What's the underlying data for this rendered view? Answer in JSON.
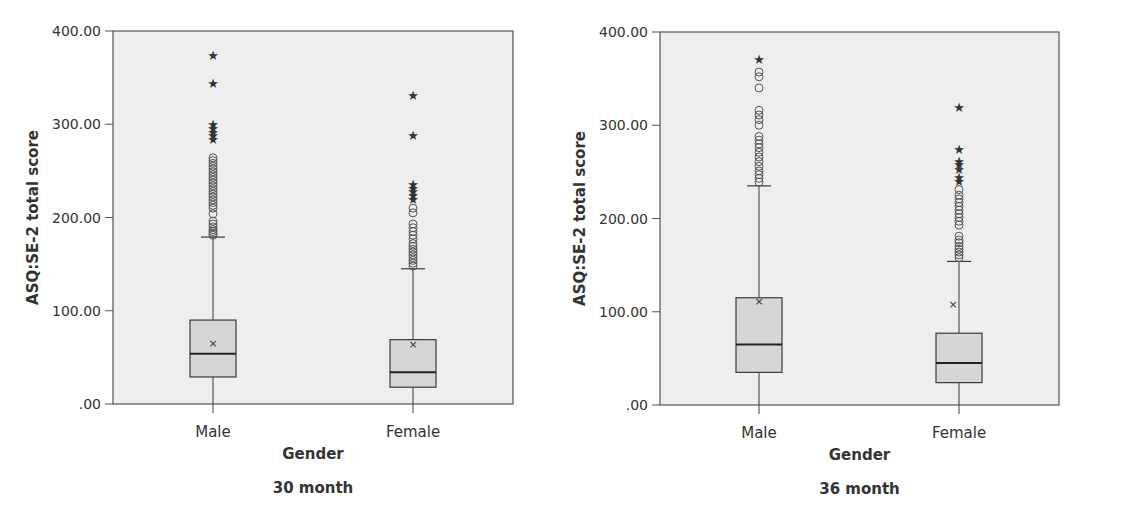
{
  "colors": {
    "plot_bg": "#eeeeee",
    "box_fill": "#d6d6d6",
    "line": "#3a3a3a",
    "text": "#333333"
  },
  "chart_data": [
    {
      "type": "box",
      "title": "30 month",
      "xlabel": "Gender",
      "ylabel": "ASQ:SE-2 total score",
      "ylim": [
        0,
        400
      ],
      "yticks": [
        ".00",
        "100.00",
        "200.00",
        "300.00",
        "400.00"
      ],
      "ytick_values": [
        0,
        100,
        200,
        300,
        400
      ],
      "grid": false,
      "categories": [
        "Male",
        "Female"
      ],
      "series": [
        {
          "name": "Male",
          "whisker_low": 0,
          "q1": 29,
          "median": 54,
          "q3": 90,
          "whisker_high": 179,
          "mean": 65,
          "outliers_circle": [
            181,
            183,
            185,
            187,
            190,
            193,
            196,
            204,
            210,
            213,
            216,
            219,
            222,
            225,
            228,
            231,
            234,
            237,
            240,
            243,
            246,
            249,
            252,
            255,
            258,
            261,
            264
          ],
          "outliers_extreme": [
            284,
            288,
            292,
            296,
            300,
            344,
            374
          ]
        },
        {
          "name": "Female",
          "whisker_low": 0,
          "q1": 18,
          "median": 34,
          "q3": 69,
          "whisker_high": 145,
          "mean": 64,
          "outliers_circle": [
            148,
            151,
            154,
            157,
            160,
            163,
            166,
            169,
            172,
            177,
            181,
            185,
            189,
            193,
            205,
            210
          ],
          "outliers_extreme": [
            220,
            224,
            228,
            232,
            236,
            289,
            331
          ]
        }
      ]
    },
    {
      "type": "box",
      "title": "36 month",
      "xlabel": "Gender",
      "ylabel": "ASQ:SE-2 total score",
      "ylim": [
        0,
        400
      ],
      "yticks": [
        ".00",
        "100.00",
        "200.00",
        "300.00",
        "400.00"
      ],
      "ytick_values": [
        0,
        100,
        200,
        300,
        400
      ],
      "grid": false,
      "categories": [
        "Male",
        "Female"
      ],
      "series": [
        {
          "name": "Male",
          "whisker_low": 0,
          "q1": 35,
          "median": 65,
          "q3": 115,
          "whisker_high": 235,
          "mean": 111,
          "outliers_circle": [
            239,
            243,
            247,
            251,
            256,
            261,
            266,
            271,
            276,
            280,
            284,
            288,
            300,
            306,
            311,
            316,
            340,
            352,
            357
          ],
          "outliers_extreme": [
            371
          ]
        },
        {
          "name": "Female",
          "whisker_low": 0,
          "q1": 24,
          "median": 45,
          "q3": 77,
          "whisker_high": 154,
          "mean": 108,
          "outliers_circle": [
            158,
            161,
            164,
            167,
            170,
            174,
            177,
            181,
            193,
            197,
            201,
            205,
            209,
            213,
            217,
            221,
            225,
            231
          ],
          "outliers_extreme": [
            240,
            244,
            253,
            258,
            262,
            274,
            320
          ]
        }
      ]
    }
  ]
}
